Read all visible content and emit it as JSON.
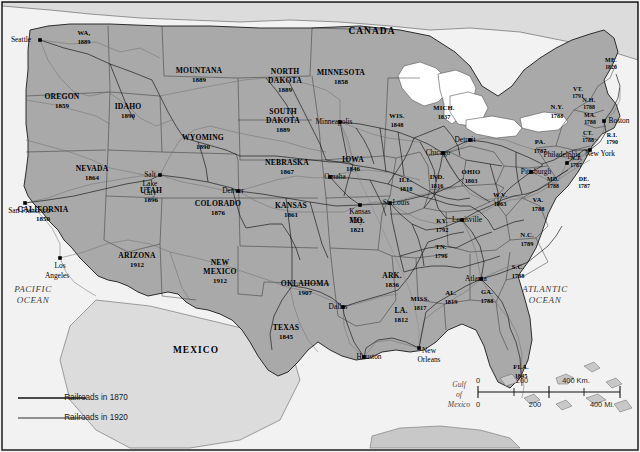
{
  "map": {
    "title": "Railroad Expansion Map of the United States",
    "colors": {
      "land": "#a9a9a9",
      "ocean": "#f2f2f2",
      "lake": "#ffffff",
      "neighbor_land": "#d8d8d8",
      "border": "#000000",
      "rail_1870": "#000000",
      "rail_1920": "#6b6b6b"
    },
    "countries": [
      {
        "name": "CANADA",
        "x": 372,
        "y": 32
      },
      {
        "name": "MEXICO",
        "x": 196,
        "y": 351
      }
    ],
    "oceans": [
      {
        "name": "PACIFIC",
        "x": 33,
        "y": 290
      },
      {
        "name": "OCEAN",
        "x": 33,
        "y": 301
      },
      {
        "name": "ATLANTIC",
        "x": 545,
        "y": 290
      },
      {
        "name": "OCEAN",
        "x": 545,
        "y": 301
      }
    ],
    "gulf": [
      {
        "name": "Gulf",
        "x": 459,
        "y": 385
      },
      {
        "name": "of",
        "x": 459,
        "y": 395
      },
      {
        "name": "Mexico",
        "x": 459,
        "y": 405
      }
    ],
    "states": [
      {
        "name": "WA,",
        "year": "1889",
        "x": 84,
        "y": 38,
        "size": "sm"
      },
      {
        "name": "OREGON",
        "year": "1859",
        "x": 62,
        "y": 102,
        "size": ""
      },
      {
        "name": "IDAHO",
        "year": "1890",
        "x": 128,
        "y": 112,
        "size": ""
      },
      {
        "name": "MOUNTANA",
        "year": "1889",
        "x": 199,
        "y": 76,
        "size": ""
      },
      {
        "name": "WYOMING",
        "year": "1890",
        "x": 203,
        "y": 143,
        "size": ""
      },
      {
        "name": "NEVADA",
        "year": "1864",
        "x": 92,
        "y": 174,
        "size": ""
      },
      {
        "name": "UTAH",
        "year": "1896",
        "x": 151,
        "y": 196,
        "size": ""
      },
      {
        "name": "CALIFORNIA",
        "year": "1850",
        "x": 43,
        "y": 215,
        "size": ""
      },
      {
        "name": "ARIZONA",
        "year": "1912",
        "x": 137,
        "y": 261,
        "size": ""
      },
      {
        "name": "NEW",
        "year": "MEXICO",
        "year2": "1912",
        "x": 220,
        "y": 272,
        "size": ""
      },
      {
        "name": "COLORADO",
        "year": "1876",
        "x": 218,
        "y": 209,
        "size": ""
      },
      {
        "name": "NORTH",
        "year": "DAKOTA",
        "year2": "1889",
        "x": 285,
        "y": 81,
        "size": ""
      },
      {
        "name": "SOUTH",
        "year": "DAKOTA",
        "year2": "1889",
        "x": 283,
        "y": 121,
        "size": ""
      },
      {
        "name": "NEBRASKA",
        "year": "1867",
        "x": 287,
        "y": 168,
        "size": ""
      },
      {
        "name": "KANSAS",
        "year": "1861",
        "x": 291,
        "y": 211,
        "size": ""
      },
      {
        "name": "OKLAHOMA",
        "year": "1907",
        "x": 305,
        "y": 289,
        "size": ""
      },
      {
        "name": "TEXAS",
        "year": "1845",
        "x": 286,
        "y": 333,
        "size": ""
      },
      {
        "name": "MINNESOTA",
        "year": "1858",
        "x": 341,
        "y": 78,
        "size": ""
      },
      {
        "name": "IOWA",
        "year": "1846",
        "x": 353,
        "y": 165,
        "size": ""
      },
      {
        "name": "MO.",
        "year": "1821",
        "x": 357,
        "y": 226,
        "size": ""
      },
      {
        "name": "ARK.",
        "year": "1836",
        "x": 392,
        "y": 281,
        "size": ""
      },
      {
        "name": "LA.",
        "year": "1812",
        "x": 401,
        "y": 316,
        "size": ""
      },
      {
        "name": "MISS.",
        "year": "1817",
        "x": 420,
        "y": 304,
        "size": "sm"
      },
      {
        "name": "AL.",
        "year": "1819",
        "x": 451,
        "y": 298,
        "size": "sm"
      },
      {
        "name": "WIS.",
        "year": "1848",
        "x": 397,
        "y": 121,
        "size": "sm"
      },
      {
        "name": "ILL.",
        "year": "1818",
        "x": 406,
        "y": 185,
        "size": "sm"
      },
      {
        "name": "IND.",
        "year": "1816",
        "x": 437,
        "y": 182,
        "size": "sm"
      },
      {
        "name": "MICH.",
        "year": "1837",
        "x": 444,
        "y": 113,
        "size": "sm"
      },
      {
        "name": "OHIO",
        "year": "1803",
        "x": 471,
        "y": 177,
        "size": "sm"
      },
      {
        "name": "KY.",
        "year": "1792",
        "x": 442,
        "y": 226,
        "size": "sm"
      },
      {
        "name": "TN.",
        "year": "1796",
        "x": 441,
        "y": 252,
        "size": "sm"
      },
      {
        "name": "GA.",
        "year": "1788",
        "x": 487,
        "y": 297,
        "size": "sm"
      },
      {
        "name": "FLA.",
        "year": "1845",
        "x": 521,
        "y": 372,
        "size": "sm"
      },
      {
        "name": "S.C.",
        "year": "1788",
        "x": 518,
        "y": 272,
        "size": "sm"
      },
      {
        "name": "N.C.",
        "year": "1789",
        "x": 527,
        "y": 240,
        "size": "sm"
      },
      {
        "name": "VA.",
        "year": "1788",
        "x": 538,
        "y": 205,
        "size": "sm"
      },
      {
        "name": "W.V.",
        "year": "1863",
        "x": 500,
        "y": 200,
        "size": "sm"
      },
      {
        "name": "PA.",
        "year": "1787",
        "x": 540,
        "y": 147,
        "size": "sm"
      },
      {
        "name": "N.Y.",
        "year": "1788",
        "x": 557,
        "y": 112,
        "size": "sm"
      },
      {
        "name": "VT.",
        "year": "1791",
        "x": 578,
        "y": 93,
        "size": "xs"
      },
      {
        "name": "N.H.",
        "year": "1788",
        "x": 589,
        "y": 104,
        "size": "xs"
      },
      {
        "name": "MA.",
        "year": "1788",
        "x": 590,
        "y": 119,
        "size": "xs"
      },
      {
        "name": "CT.",
        "year": "1788",
        "x": 588,
        "y": 137,
        "size": "xs"
      },
      {
        "name": "R.I.",
        "year": "1790",
        "x": 612,
        "y": 139,
        "size": "xs"
      },
      {
        "name": "ME.",
        "year": "1820",
        "x": 611,
        "y": 64,
        "size": "xs"
      },
      {
        "name": "N.J.",
        "year": "1787",
        "x": 576,
        "y": 162,
        "size": "xs"
      },
      {
        "name": "DE.",
        "year": "1787",
        "x": 584,
        "y": 183,
        "size": "xs"
      },
      {
        "name": "MD.",
        "year": "1788",
        "x": 553,
        "y": 183,
        "size": "xs"
      }
    ],
    "cities": [
      {
        "name": "Seattle",
        "x": 40,
        "y": 40,
        "dx": -19,
        "dy": 0,
        "anchor": "end"
      },
      {
        "name": "San Francisco",
        "x": 25,
        "y": 203,
        "dx": 4,
        "dy": 8,
        "anchor": "start"
      },
      {
        "name": "Los",
        "x": 60,
        "y": 266,
        "dx": 0,
        "dy": 0,
        "anchor": "middle"
      },
      {
        "name": "Angeles",
        "x": 57,
        "y": 276,
        "dx": 0,
        "dy": 0,
        "anchor": "middle"
      },
      {
        "name": "Salt",
        "x": 150,
        "y": 175,
        "dx": 0,
        "dy": 0,
        "anchor": "middle"
      },
      {
        "name": "Lake",
        "x": 150,
        "y": 184,
        "dx": 0,
        "dy": 0,
        "anchor": "middle"
      },
      {
        "name": "City",
        "x": 150,
        "y": 193,
        "dx": 0,
        "dy": 0,
        "anchor": "middle"
      },
      {
        "name": "Denver",
        "x": 238,
        "y": 191,
        "dx": -5,
        "dy": 0,
        "anchor": "end"
      },
      {
        "name": "Minneapolis",
        "x": 340,
        "y": 122,
        "dx": -6,
        "dy": 0,
        "anchor": "end"
      },
      {
        "name": "Omaha",
        "x": 330,
        "y": 177,
        "dx": 5,
        "dy": 0,
        "anchor": "start"
      },
      {
        "name": "Kansas",
        "x": 360,
        "y": 212,
        "dx": 0,
        "dy": 0,
        "anchor": "middle"
      },
      {
        "name": "City",
        "x": 357,
        "y": 221,
        "dx": 0,
        "dy": 0,
        "anchor": "middle"
      },
      {
        "name": "Chicago",
        "x": 443,
        "y": 153,
        "dx": -5,
        "dy": 0,
        "anchor": "end"
      },
      {
        "name": "St. Louis",
        "x": 390,
        "y": 203,
        "dx": 6,
        "dy": 0,
        "anchor": "start"
      },
      {
        "name": "Detroit",
        "x": 470,
        "y": 140,
        "dx": -5,
        "dy": 0,
        "anchor": "end"
      },
      {
        "name": "Louisville",
        "x": 462,
        "y": 220,
        "dx": 5,
        "dy": 0,
        "anchor": "start"
      },
      {
        "name": "Atlanta",
        "x": 481,
        "y": 279,
        "dx": -5,
        "dy": 0,
        "anchor": "end"
      },
      {
        "name": "Dallas",
        "x": 343,
        "y": 307,
        "dx": -5,
        "dy": 0,
        "anchor": "end"
      },
      {
        "name": "Houston",
        "x": 364,
        "y": 357,
        "dx": 5,
        "dy": 0,
        "anchor": "start"
      },
      {
        "name": "New",
        "x": 424,
        "y": 351,
        "dx": 5,
        "dy": 0,
        "anchor": "start"
      },
      {
        "name": "Orleans",
        "x": 424,
        "y": 360,
        "dx": 5,
        "dy": 0,
        "anchor": "start"
      },
      {
        "name": "Boston",
        "x": 614,
        "y": 121,
        "dx": 5,
        "dy": 0,
        "anchor": "start"
      },
      {
        "name": "New York",
        "x": 595,
        "y": 154,
        "dx": 5,
        "dy": 0,
        "anchor": "start"
      },
      {
        "name": "Philadelphia",
        "x": 567,
        "y": 163,
        "dx": -5,
        "dy": -8,
        "anchor": "end"
      },
      {
        "name": "Pittsburgh",
        "x": 531,
        "y": 172,
        "dx": 5,
        "dy": 0,
        "anchor": "start"
      }
    ],
    "city_dots": [
      {
        "x": 40,
        "y": 40
      },
      {
        "x": 25,
        "y": 203
      },
      {
        "x": 60,
        "y": 258
      },
      {
        "x": 160,
        "y": 175
      },
      {
        "x": 238,
        "y": 191
      },
      {
        "x": 340,
        "y": 122
      },
      {
        "x": 330,
        "y": 177
      },
      {
        "x": 360,
        "y": 205
      },
      {
        "x": 443,
        "y": 153
      },
      {
        "x": 390,
        "y": 203
      },
      {
        "x": 470,
        "y": 140
      },
      {
        "x": 462,
        "y": 220
      },
      {
        "x": 481,
        "y": 279
      },
      {
        "x": 343,
        "y": 307
      },
      {
        "x": 364,
        "y": 357
      },
      {
        "x": 419,
        "y": 348
      },
      {
        "x": 604,
        "y": 121
      },
      {
        "x": 590,
        "y": 150
      },
      {
        "x": 567,
        "y": 163
      },
      {
        "x": 531,
        "y": 172
      }
    ],
    "legend": {
      "items": [
        {
          "label": "Railroads in 1870",
          "color": "#111111",
          "y": 398
        },
        {
          "label": "Railroads in 1920",
          "color": "#6f6f6f",
          "y": 418
        }
      ]
    },
    "scale": {
      "km": {
        "ticks": [
          "0",
          "200",
          "400 Km."
        ],
        "unit": "Km."
      },
      "mi": {
        "ticks": [
          "0",
          "200",
          "400 Mi."
        ],
        "unit": "Mi."
      },
      "km_labels": [
        {
          "t": "0",
          "x": 478
        },
        {
          "t": "200",
          "x": 522
        },
        {
          "t": "400 Km.",
          "x": 576
        }
      ],
      "mi_labels": [
        {
          "t": "0",
          "x": 478
        },
        {
          "t": "200",
          "x": 535
        },
        {
          "t": "400 Mi.",
          "x": 602
        }
      ]
    }
  }
}
